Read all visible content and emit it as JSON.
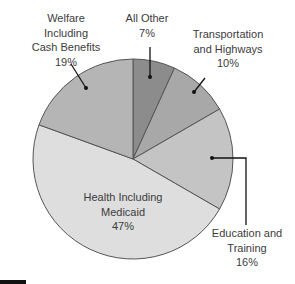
{
  "chart_data": {
    "type": "pie",
    "title": "",
    "center": [
      133,
      159
    ],
    "radius": 100,
    "start_angle_deg": 0,
    "direction": "clockwise",
    "slices": [
      {
        "name": "All Other",
        "value": 7,
        "label_lines": [
          "All Other",
          "7%"
        ],
        "color": "#8c8c8c"
      },
      {
        "name": "Transportation and Highways",
        "value": 10,
        "label_lines": [
          "Transportation",
          "and Highways",
          "10%"
        ],
        "color": "#a8a8a8"
      },
      {
        "name": "Education and Training",
        "value": 16,
        "label_lines": [
          "Education and",
          "Training",
          "16%"
        ],
        "color": "#c4c4c4"
      },
      {
        "name": "Health Including Medicaid",
        "value": 47,
        "label_lines": [
          "Health Including",
          "Medicaid",
          "47%"
        ],
        "color": "#dedede"
      },
      {
        "name": "Welfare Including Cash Benefits",
        "value": 19,
        "label_lines": [
          "Welfare",
          "Including",
          "Cash Benefits",
          "19%"
        ],
        "color": "#b5b5b5"
      }
    ],
    "boundaries_deg": [
      0,
      24.5,
      60,
      120,
      290,
      360
    ],
    "stroke_color": "#555555",
    "legend": "none (direct labels)"
  },
  "labels": [
    {
      "x": 66,
      "y": 11,
      "lines": [
        "Welfare",
        "Including",
        "Cash Benefits",
        "19%"
      ]
    },
    {
      "x": 147,
      "y": 11,
      "lines": [
        "All Other",
        "7%"
      ]
    },
    {
      "x": 228,
      "y": 27,
      "lines": [
        "Transportation",
        "and Highways",
        "10%"
      ]
    },
    {
      "x": 123,
      "y": 190,
      "lines": [
        "Health Including",
        "Medicaid",
        "47%"
      ]
    },
    {
      "x": 247,
      "y": 226,
      "lines": [
        "Education and",
        "Training",
        "16%"
      ]
    }
  ],
  "leaders": [
    {
      "points": [
        [
          71,
          64
        ],
        [
          86,
          88
        ]
      ],
      "dot": [
        86,
        88
      ]
    },
    {
      "points": [
        [
          150,
          47
        ],
        [
          150,
          77
        ]
      ],
      "dot": [
        150,
        77
      ]
    },
    {
      "points": [
        [
          205,
          78
        ],
        [
          194,
          92
        ]
      ],
      "dot": [
        194,
        92
      ]
    },
    {
      "points": [
        [
          212,
          158
        ],
        [
          246,
          158
        ],
        [
          246,
          225
        ]
      ],
      "dot": [
        212,
        158
      ]
    }
  ]
}
